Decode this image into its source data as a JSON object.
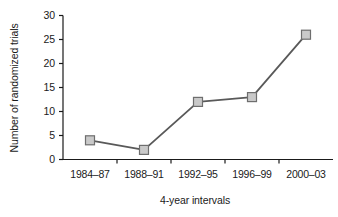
{
  "chart_data": {
    "type": "line",
    "title": "",
    "xlabel": "4-year intervals",
    "ylabel": "Number of randomized trials",
    "categories": [
      "1984–87",
      "1988–91",
      "1992–95",
      "1996–99",
      "2000–03"
    ],
    "values": [
      4,
      2,
      12,
      13,
      26
    ],
    "yticks": [
      0,
      5,
      10,
      15,
      20,
      25,
      30
    ],
    "ytick_labels": [
      "0",
      "5",
      "10",
      "15",
      "20",
      "25",
      "30"
    ],
    "ylim": [
      0,
      30
    ],
    "grid": false,
    "legend": false,
    "marker": "square",
    "series": [
      {
        "name": "Number of randomized trials",
        "values": [
          4,
          2,
          12,
          13,
          26
        ]
      }
    ]
  },
  "style": {
    "line_color": "#595959",
    "marker_fill": "#c9c9c9",
    "marker_edge": "#6e6e6e",
    "axis_color": "#1a1a1a",
    "background": "#ffffff",
    "text_color": "#1a1a1a"
  }
}
